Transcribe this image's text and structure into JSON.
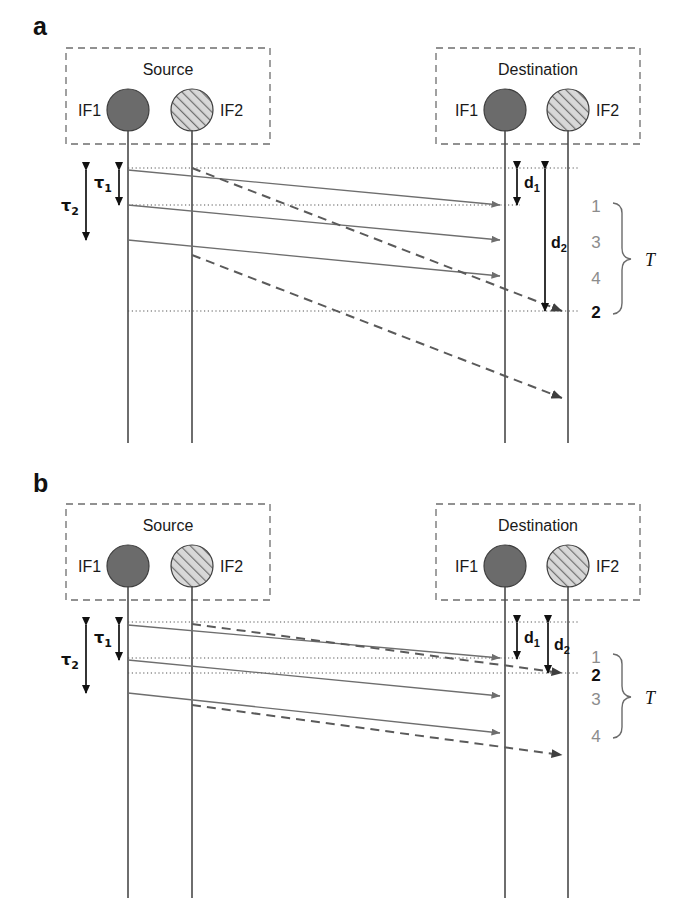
{
  "figure": {
    "type": "sequence-timing-diagram",
    "panels": [
      {
        "id": "a",
        "letter": "a",
        "source": {
          "title": "Source",
          "interfaces": [
            {
              "label": "IF1",
              "style": "filled"
            },
            {
              "label": "IF2",
              "style": "hatched"
            }
          ]
        },
        "destination": {
          "title": "Destination",
          "interfaces": [
            {
              "label": "IF1",
              "style": "filled"
            },
            {
              "label": "IF2",
              "style": "hatched"
            }
          ]
        },
        "delay_labels": {
          "tau1": {
            "base": "τ",
            "sub": "1"
          },
          "tau2": {
            "base": "τ",
            "sub": "2"
          },
          "d1": {
            "base": "d",
            "sub": "1"
          },
          "d2": {
            "base": "d",
            "sub": "2"
          }
        },
        "arrival_order": [
          {
            "value": "1",
            "emphasis": false
          },
          {
            "value": "3",
            "emphasis": false
          },
          {
            "value": "4",
            "emphasis": false
          },
          {
            "value": "2",
            "emphasis": true
          }
        ],
        "span_label": "T"
      },
      {
        "id": "b",
        "letter": "b",
        "source": {
          "title": "Source",
          "interfaces": [
            {
              "label": "IF1",
              "style": "filled"
            },
            {
              "label": "IF2",
              "style": "hatched"
            }
          ]
        },
        "destination": {
          "title": "Destination",
          "interfaces": [
            {
              "label": "IF1",
              "style": "filled"
            },
            {
              "label": "IF2",
              "style": "hatched"
            }
          ]
        },
        "delay_labels": {
          "tau1": {
            "base": "τ",
            "sub": "1"
          },
          "tau2": {
            "base": "τ",
            "sub": "2"
          },
          "d1": {
            "base": "d",
            "sub": "1"
          },
          "d2": {
            "base": "d",
            "sub": "2"
          }
        },
        "arrival_order": [
          {
            "value": "1",
            "emphasis": false
          },
          {
            "value": "2",
            "emphasis": true
          },
          {
            "value": "3",
            "emphasis": false
          },
          {
            "value": "4",
            "emphasis": false
          }
        ],
        "span_label": "T"
      }
    ],
    "colors": {
      "ink": "#111111",
      "line": "#6e6e6e",
      "lifeline": "#4a4a4a",
      "muted": "#8c8c8c",
      "if1_fill": "#6b6b6b",
      "if2_fill": "#cfcfcf",
      "background": "#ffffff"
    }
  }
}
